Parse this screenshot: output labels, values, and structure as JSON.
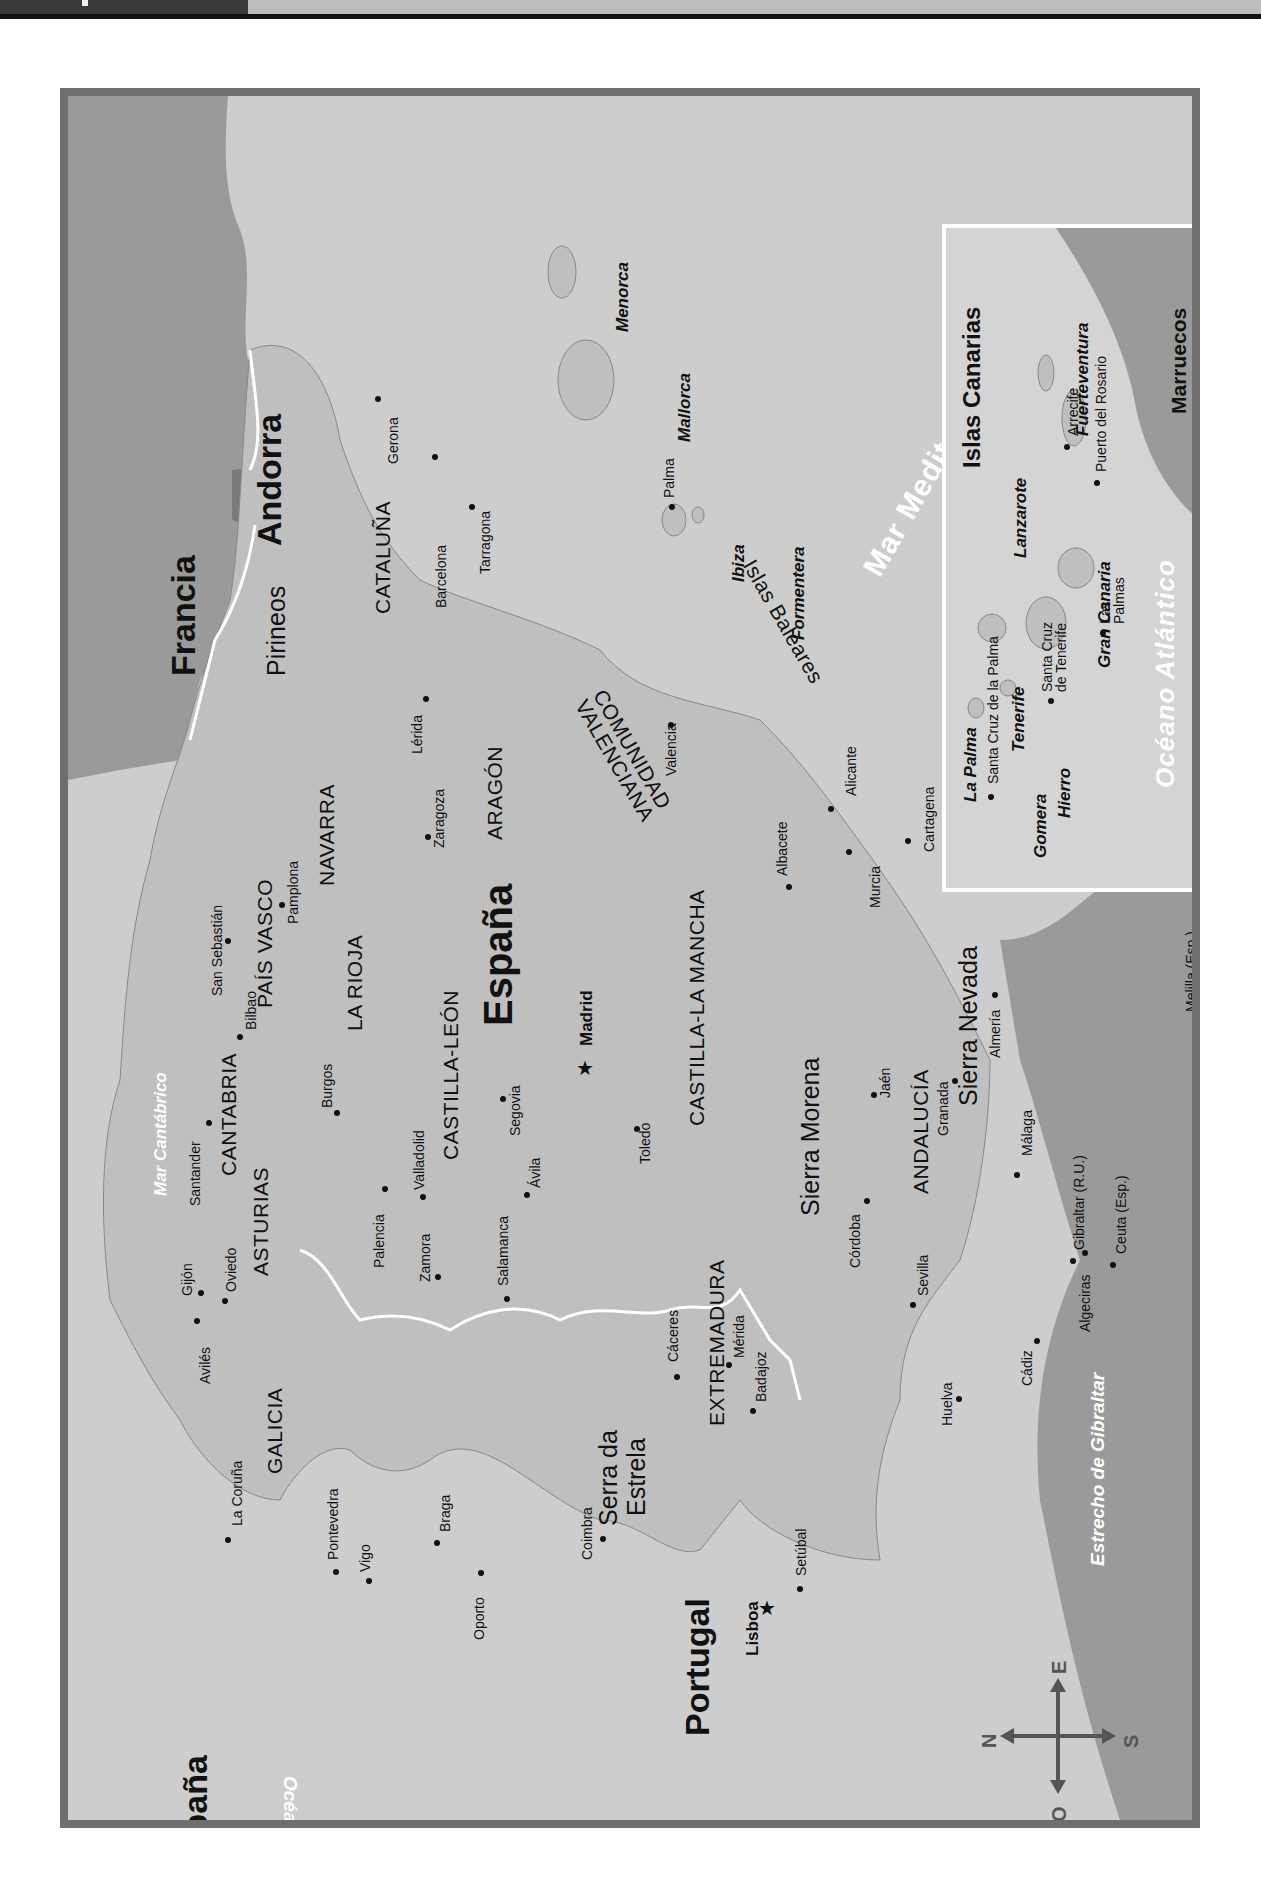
{
  "map": {
    "title_countries": {
      "espana_main": "España",
      "espana_corner": "España",
      "francia": "Francia",
      "andorra": "Andorra",
      "portugal": "Portugal",
      "marruecos": "Marruecos"
    },
    "capitals": [
      {
        "name": "Madrid",
        "symbol": "star"
      },
      {
        "name": "Lisboa",
        "symbol": "star"
      }
    ],
    "regions": [
      "GALICIA",
      "ASTURIAS",
      "CANTABRIA",
      "PAÍS VASCO",
      "NAVARRA",
      "LA RIOJA",
      "CATALUÑA",
      "ARAGÓN",
      "CASTILLA-LEÓN",
      "CASTILLA-LA MANCHA",
      "COMUNIDAD",
      "VALENCIANA",
      "EXTREMADURA",
      "ANDALUCÍA"
    ],
    "cities": [
      "Gerona",
      "Barcelona",
      "Tarragona",
      "Lérida",
      "Zaragoza",
      "Valencia",
      "Alicante",
      "Albacete",
      "Murcia",
      "Cartagena",
      "Almería",
      "Granada",
      "Jaén",
      "Córdoba",
      "Sevilla",
      "Huelva",
      "Cádiz",
      "Málaga",
      "Algeciras",
      "Gibraltar (R.U.)",
      "Ceuta (Esp.)",
      "Melilla (Esp.)",
      "Toledo",
      "Segovia",
      "Ávila",
      "Salamanca",
      "Valladolid",
      "Palencia",
      "Zamora",
      "Burgos",
      "Bilbao",
      "San Sebastián",
      "Pamplona",
      "Santander",
      "Oviedo",
      "Gijón",
      "Avilés",
      "La Coruña",
      "Pontevedra",
      "Vigo",
      "Braga",
      "Oporto",
      "Coimbra",
      "Setúbal",
      "Cáceres",
      "Mérida",
      "Badajoz",
      "Palma"
    ],
    "mountains": [
      "Pirineos",
      "Sierra Morena",
      "Sierra Nevada",
      "Serra da",
      "Estrela"
    ],
    "seas": {
      "cantabrico": "Mar Cantábrico",
      "mediterraneo": "Mar Mediterráneo",
      "atlantico": "Océano Atlántico",
      "gibraltar": "Estrecho de Gibraltar"
    },
    "baleares": {
      "group": "Islas Baleares",
      "islands": [
        "Menorca",
        "Mallorca",
        "Ibiza",
        "Formentera"
      ]
    },
    "inset": {
      "title": "Islas Canarias",
      "islands": [
        "La Palma",
        "Tenerife",
        "Gomera",
        "Hierro",
        "Gran Canaria",
        "Lanzarote",
        "Fuerteventura"
      ],
      "cities": [
        "Santa Cruz de la Palma",
        "Santa Cruz",
        "de Tenerife",
        "Las",
        "Palmas",
        "Arrecife",
        "Puerto del Rosario"
      ],
      "ocean": "Océano Atlántico",
      "country": "Marruecos"
    },
    "compass": {
      "north": "N",
      "south": "S",
      "east": "E",
      "west": "O"
    },
    "colors": {
      "land": "#bfbfbf",
      "sea": "#cdcdcd",
      "foreign": "#9a9a9a",
      "frame": "#6e6e6e",
      "border": "#ffffff"
    }
  }
}
